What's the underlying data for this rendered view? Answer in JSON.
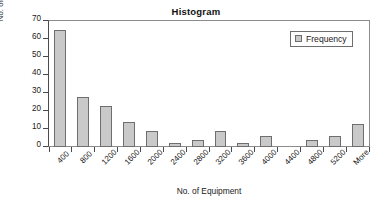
{
  "chart_data": {
    "type": "bar",
    "title": "Histogram",
    "xlabel": "No. of Equipment",
    "ylabel": "No. of Respondents",
    "categories": [
      "400",
      "800",
      "1200",
      "1600",
      "2000",
      "2400",
      "2800",
      "3200",
      "3600",
      "4000",
      "4400",
      "4800",
      "5200",
      "More"
    ],
    "values": [
      65,
      28,
      23,
      14,
      9,
      2,
      4,
      9,
      2,
      6,
      0,
      4,
      6,
      13
    ],
    "series": [
      {
        "name": "Frequency",
        "values": [
          65,
          28,
          23,
          14,
          9,
          2,
          4,
          9,
          2,
          6,
          0,
          4,
          6,
          13
        ]
      }
    ],
    "ylim": [
      0,
      70
    ],
    "yticks": [
      0,
      10,
      20,
      30,
      40,
      50,
      60,
      70
    ],
    "ytick_labels": [
      "0",
      "10",
      "20",
      "30",
      "40",
      "50",
      "60",
      "70"
    ],
    "grid": false,
    "legend_position": "top-right",
    "legend_entries": [
      "Frequency"
    ],
    "bar_color": "#c9c9c9",
    "bar_border_color": "#6e6e6e",
    "axis_color": "#4a4a4a",
    "xtick_label_rotation": "-45"
  },
  "legend": {
    "frequency_label": "Frequency"
  }
}
